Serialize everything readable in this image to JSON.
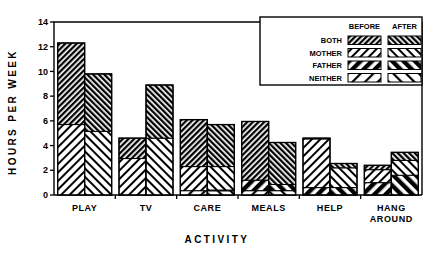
{
  "chart_data": {
    "type": "bar",
    "title": "",
    "subtitle": "",
    "xlabel": "ACTIVITY",
    "ylabel": "HOURS PER WEEK",
    "ylim": [
      0,
      14
    ],
    "yticks": [
      0,
      2,
      4,
      6,
      8,
      10,
      12,
      14
    ],
    "ytick_labels": [
      "0",
      "2",
      "4",
      "6",
      "8",
      "10",
      "12",
      "14"
    ],
    "grid": false,
    "stacked": true,
    "legend_position": "top-right",
    "categories": [
      "PLAY",
      "TV",
      "CARE",
      "MEALS",
      "HELP",
      "HANG AROUND"
    ],
    "group_labels": [
      "BEFORE",
      "AFTER"
    ],
    "stack_order_bottom_to_top": [
      "NEITHER",
      "FATHER",
      "MOTHER",
      "BOTH"
    ],
    "series": [
      {
        "name": "NEITHER",
        "before": [
          0.0,
          0.0,
          0.35,
          0.35,
          0.0,
          0.0
        ],
        "after": [
          0.0,
          0.0,
          0.35,
          0.35,
          0.0,
          0.0
        ]
      },
      {
        "name": "FATHER",
        "before": [
          0.0,
          0.0,
          0.0,
          0.85,
          0.6,
          1.0
        ],
        "after": [
          0.0,
          0.0,
          0.05,
          0.5,
          0.6,
          1.6
        ]
      },
      {
        "name": "MOTHER",
        "before": [
          5.7,
          2.95,
          1.95,
          0.0,
          3.95,
          1.05
        ],
        "after": [
          5.15,
          4.6,
          1.9,
          0.0,
          1.6,
          1.2
        ]
      },
      {
        "name": "BOTH",
        "before": [
          6.6,
          1.65,
          3.8,
          4.75,
          0.05,
          0.35
        ],
        "after": [
          4.65,
          4.3,
          3.4,
          3.4,
          0.35,
          0.65
        ]
      }
    ],
    "totals": {
      "before": [
        12.3,
        4.6,
        6.1,
        5.95,
        4.6,
        2.4
      ],
      "after": [
        9.8,
        8.9,
        5.7,
        4.25,
        2.55,
        3.45
      ]
    }
  },
  "legend": {
    "col_headers": [
      "BEFORE",
      "AFTER"
    ],
    "rows": [
      {
        "label": "BOTH"
      },
      {
        "label": "MOTHER"
      },
      {
        "label": "FATHER"
      },
      {
        "label": "NEITHER"
      }
    ]
  }
}
